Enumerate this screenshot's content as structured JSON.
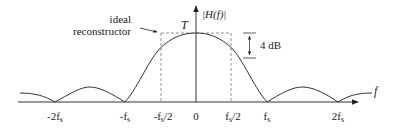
{
  "diagram": {
    "y_axis_label": "|H(f)|",
    "x_axis_label": "f",
    "peak_label": "T",
    "annotation_ideal": [
      "ideal",
      "reconstructor"
    ],
    "droop_label": "4 dB",
    "x_ticks": [
      {
        "label": "-2f",
        "sub": "s",
        "x": 55
      },
      {
        "label": "-f",
        "sub": "s",
        "x": 125
      },
      {
        "label": "-f",
        "sub": "s",
        "suffix": "/2",
        "x": 161
      },
      {
        "label": "0",
        "sub": "",
        "x": 196
      },
      {
        "label": "f",
        "sub": "s",
        "suffix": "/2",
        "x": 231
      },
      {
        "label": "f",
        "sub": "s",
        "x": 267
      },
      {
        "label": "2f",
        "sub": "s",
        "x": 338
      }
    ],
    "colors": {
      "curve": "#333333",
      "axis": "#333333",
      "dashed": "#777777",
      "text": "#222222"
    }
  }
}
